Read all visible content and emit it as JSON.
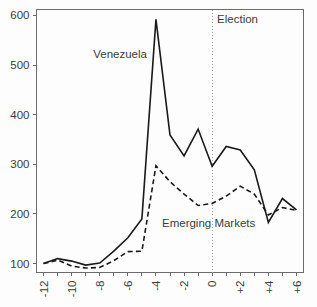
{
  "chart_data": {
    "type": "line",
    "title": "",
    "subtitle": "",
    "xlabel": "",
    "ylabel": "",
    "xlim": [
      -12.5,
      6.5
    ],
    "ylim": [
      82,
      612
    ],
    "grid": false,
    "legend_position": "inline-annotations",
    "x": [
      -12,
      -11,
      -10,
      -9,
      -8,
      -7,
      -6,
      -5,
      -4,
      -3,
      -2,
      -1,
      0,
      1,
      2,
      3,
      4,
      5,
      6
    ],
    "x_tick_labels": [
      "-12",
      "-10",
      "-8",
      "-6",
      "-4",
      "-2",
      "0",
      "+2",
      "+4",
      "+6"
    ],
    "x_tick_values": [
      -12,
      -10,
      -8,
      -6,
      -4,
      -2,
      0,
      2,
      4,
      6
    ],
    "x_minor_tick_values": [
      -11,
      -9,
      -7,
      -5,
      -3,
      -1,
      1,
      3,
      5
    ],
    "y_tick_labels": [
      "100",
      "200",
      "300",
      "400",
      "500",
      "600"
    ],
    "y_tick_values": [
      100,
      200,
      300,
      400,
      500,
      600
    ],
    "series": [
      {
        "name": "Venezuela",
        "style": "solid",
        "color": "#1a1a1a",
        "label_text": "Venezuela",
        "label_x": -6.55,
        "label_y": 522,
        "values": [
          100,
          110,
          105,
          97,
          101,
          125,
          152,
          190,
          592,
          359,
          317,
          371,
          296,
          336,
          329,
          289,
          183,
          231,
          208
        ]
      },
      {
        "name": "Emerging Markets",
        "style": "dashed",
        "color": "#1a1a1a",
        "label_text": "Emerging Markets",
        "label_x": -0.25,
        "label_y": 181,
        "values": [
          100,
          107,
          95,
          91,
          92,
          106,
          124,
          125,
          297,
          265,
          240,
          217,
          221,
          236,
          256,
          240,
          198,
          213,
          207
        ]
      }
    ],
    "annotations": [
      {
        "name": "election-marker",
        "text": "Election",
        "x": 0,
        "label_x": 0.35,
        "label_y": 592,
        "line_style": "dotted",
        "line_color": "#a8a8a8"
      }
    ]
  }
}
